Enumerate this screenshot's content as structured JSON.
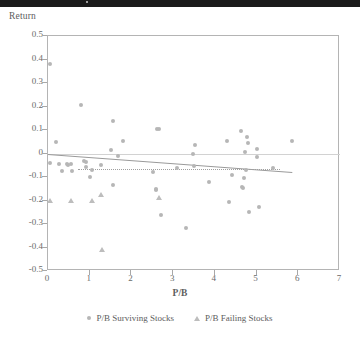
{
  "figure": {
    "background": "#ffffff",
    "marker_color": "#b6b6b6",
    "triangle_color": "#bdbdbd",
    "axis_color": "#b4b4b4",
    "trend_color": "#9a9a9a"
  },
  "scan_artifact": {
    "name": "top-black-scan-band"
  },
  "chart_data": {
    "type": "scatter",
    "title": "",
    "xlabel": "P/B",
    "ylabel": "Return",
    "xlim": [
      0,
      7
    ],
    "ylim": [
      -0.5,
      0.5
    ],
    "xticks": [
      0,
      1,
      2,
      3,
      4,
      5,
      6,
      7
    ],
    "xtick_labels": [
      "0",
      "1",
      "2",
      "3",
      "4",
      "5",
      "6",
      "7"
    ],
    "yticks": [
      0.5,
      0.4,
      0.3,
      0.2,
      0.1,
      0,
      -0.1,
      -0.2,
      -0.3,
      -0.4,
      -0.5
    ],
    "ytick_labels": [
      "0.5",
      "0.4",
      "0.3",
      "0.2",
      "0.1",
      "0",
      "-0.1",
      "-0.2",
      "-0.3",
      "-0.4",
      "-0.5"
    ],
    "grid": false,
    "legend_position": "below-axes",
    "legend": [
      {
        "label": "P/B Surviving Stocks",
        "marker": "circle"
      },
      {
        "label": "P/B Failing Stocks",
        "marker": "triangle"
      }
    ],
    "reference_lines": [
      {
        "name": "zero-line",
        "type": "horizontal",
        "y": 0
      }
    ],
    "trendlines": [
      {
        "name": "surviving-trendline",
        "style": "solid",
        "x0": 0.0,
        "y0": 0.0,
        "x1": 5.85,
        "y1": -0.077
      },
      {
        "name": "failing-trendline",
        "style": "dotted",
        "x0": 0.72,
        "y0": -0.064,
        "x1": 5.55,
        "y1": -0.064
      }
    ],
    "series": [
      {
        "name": "P/B Surviving Stocks",
        "marker": "circle",
        "points": [
          [
            0.05,
            0.38
          ],
          [
            0.05,
            -0.04
          ],
          [
            0.2,
            0.05
          ],
          [
            0.27,
            -0.045
          ],
          [
            0.33,
            -0.075
          ],
          [
            0.45,
            -0.045
          ],
          [
            0.47,
            -0.048
          ],
          [
            0.55,
            -0.045
          ],
          [
            0.57,
            -0.075
          ],
          [
            0.8,
            0.205
          ],
          [
            0.86,
            -0.032
          ],
          [
            0.9,
            -0.038
          ],
          [
            0.92,
            -0.056
          ],
          [
            1.0,
            -0.1
          ],
          [
            1.05,
            -0.072
          ],
          [
            1.28,
            -0.047
          ],
          [
            1.5,
            0.013
          ],
          [
            1.55,
            0.138
          ],
          [
            1.57,
            -0.133
          ],
          [
            1.68,
            -0.012
          ],
          [
            1.8,
            0.055
          ],
          [
            2.52,
            -0.078
          ],
          [
            2.58,
            -0.15
          ],
          [
            2.6,
            -0.157
          ],
          [
            2.62,
            0.106
          ],
          [
            2.65,
            0.104
          ],
          [
            2.7,
            -0.262
          ],
          [
            3.1,
            -0.06
          ],
          [
            3.3,
            -0.315
          ],
          [
            3.48,
            0.0
          ],
          [
            3.5,
            -0.055
          ],
          [
            3.52,
            0.037
          ],
          [
            3.85,
            -0.122
          ],
          [
            4.3,
            0.053
          ],
          [
            4.33,
            -0.205
          ],
          [
            4.42,
            -0.09
          ],
          [
            4.63,
            0.097
          ],
          [
            4.65,
            -0.142
          ],
          [
            4.68,
            -0.145
          ],
          [
            4.7,
            -0.105
          ],
          [
            4.72,
            0.007
          ],
          [
            4.74,
            -0.07
          ],
          [
            4.78,
            0.07
          ],
          [
            4.8,
            0.043
          ],
          [
            4.82,
            -0.25
          ],
          [
            5.0,
            -0.013
          ],
          [
            5.02,
            0.018
          ],
          [
            5.05,
            -0.228
          ],
          [
            5.4,
            -0.063
          ],
          [
            5.85,
            0.052
          ]
        ]
      },
      {
        "name": "P/B Failing Stocks",
        "marker": "triangle",
        "points": [
          [
            0.05,
            -0.2
          ],
          [
            0.55,
            -0.2
          ],
          [
            1.05,
            -0.2
          ],
          [
            1.28,
            -0.175
          ],
          [
            1.3,
            -0.408
          ],
          [
            2.65,
            -0.188
          ]
        ]
      }
    ]
  }
}
